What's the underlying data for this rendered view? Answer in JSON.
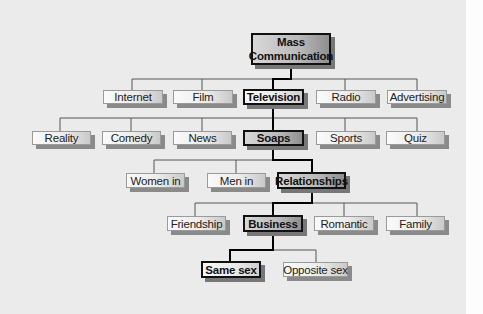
{
  "diagram": {
    "type": "hierarchy-tree",
    "highlighted_path": [
      "Mass Communication",
      "Television",
      "Soaps",
      "Relationships",
      "Business",
      "Same sex"
    ],
    "root": {
      "line1": "Mass",
      "line2": "Communication"
    },
    "levels": [
      {
        "parent": "Mass Communication",
        "nodes": [
          "Internet",
          "Film",
          "Television",
          "Radio",
          "Advertising"
        ]
      },
      {
        "parent": "Television",
        "nodes": [
          "Reality",
          "Comedy",
          "News",
          "Soaps",
          "Sports",
          "Quiz"
        ]
      },
      {
        "parent": "Soaps",
        "nodes": [
          "Women in",
          "Men in",
          "Relationships"
        ]
      },
      {
        "parent": "Relationships",
        "nodes": [
          "Friendship",
          "Business",
          "Romantic",
          "Family"
        ]
      },
      {
        "parent": "Business",
        "nodes": [
          "Same sex",
          "Opposite sex"
        ]
      }
    ],
    "colors": {
      "highlight_border": "#111111",
      "normal_border": "#9a9a9a",
      "connector_normal": "#555555",
      "connector_highlight": "#000000",
      "background": "#ebebeb"
    }
  }
}
